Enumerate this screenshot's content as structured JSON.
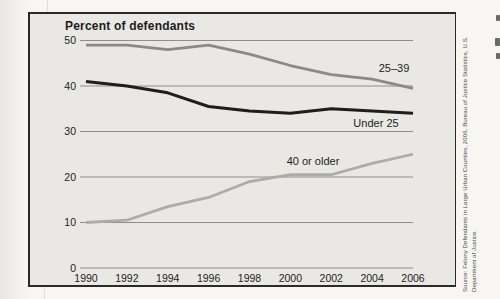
{
  "colors": {
    "page_background": "#f7f6f3",
    "chart_background": "#e9e8e4",
    "frame_border": "#2a2a28",
    "gridline": "#8e8e8c",
    "text": "#1c1c1c",
    "source_text": "#4a4742"
  },
  "chart_data": {
    "type": "line",
    "title": "Percent of defendants",
    "xlabel": "",
    "ylabel": "Percent of defendants",
    "x_tick_labels": [
      "1990",
      "1992",
      "1994",
      "1996",
      "1998",
      "2000",
      "2002",
      "2004",
      "2006"
    ],
    "y_ticks": [
      0,
      10,
      20,
      30,
      40,
      50
    ],
    "ylim": [
      0,
      50
    ],
    "grid": "horizontal-only",
    "legend_position": "inline-labels-on-chart",
    "series": [
      {
        "name": "25–39",
        "values": [
          49,
          49,
          48,
          49,
          47,
          44.5,
          42.5,
          41.5,
          39.5
        ],
        "color": "#8a8a88",
        "stroke_width": 2.8,
        "label_xy": [
          394,
          72
        ]
      },
      {
        "name": "Under 25",
        "values": [
          41,
          40,
          38.5,
          35.5,
          34.5,
          34,
          35,
          34.5,
          34
        ],
        "color": "#1e1e1e",
        "stroke_width": 3,
        "label_xy": [
          376,
          127
        ]
      },
      {
        "name": "40 or older",
        "values": [
          10,
          10.5,
          13.5,
          15.5,
          19,
          20.5,
          20.5,
          23,
          25
        ],
        "color": "#acacaa",
        "stroke_width": 2.8,
        "label_xy": [
          313,
          165
        ]
      }
    ]
  },
  "source_note": {
    "line1": "Source: Felony Defendants in Large Urban Counties, 2006, Bureau of Justice Statistics, U.S.",
    "line2": "Department of Justice."
  }
}
